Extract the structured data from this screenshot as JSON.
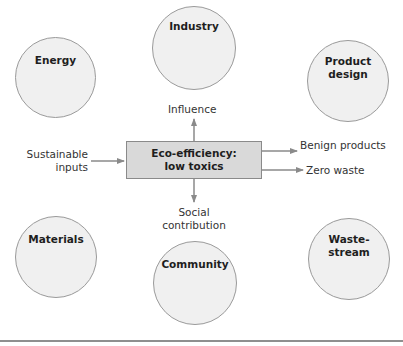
{
  "diagram": {
    "center": {
      "line1": "Eco-efficiency:",
      "line2": "low toxics"
    },
    "nodes": {
      "energy": {
        "label": "Energy"
      },
      "industry": {
        "label": "Industry"
      },
      "product_design": {
        "line1": "Product",
        "line2": "design"
      },
      "materials": {
        "label": "Materials"
      },
      "community": {
        "label": "Community"
      },
      "waste_stream": {
        "line1": "Waste-",
        "line2": "stream"
      }
    },
    "flows": {
      "influence": "Influence",
      "sustainable_inputs": {
        "line1": "Sustainable",
        "line2": "inputs"
      },
      "benign_products": "Benign products",
      "zero_waste": "Zero waste",
      "social_contribution": {
        "line1": "Social",
        "line2": "contribution"
      }
    },
    "colors": {
      "circle_fill": "#f0f0f0",
      "circle_stroke": "#9a9a9a",
      "box_fill": "#d9d9d9",
      "arrow": "#8a8a8a"
    }
  }
}
